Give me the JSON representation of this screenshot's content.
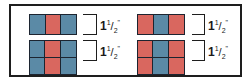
{
  "colors": {
    "blue": "#5b8aa6",
    "red": "#d9675f",
    "outline": "#1c2430"
  },
  "panels": [
    {
      "name": "left",
      "top_block": {
        "cells": [
          "blue",
          "red",
          "blue"
        ]
      },
      "bottom_block": {
        "rows": 2,
        "cells": [
          "blue",
          "red",
          "blue",
          "blue",
          "red",
          "blue"
        ]
      },
      "labels": [
        {
          "whole": "1",
          "num": "1",
          "den": "2",
          "unit": "\""
        },
        {
          "whole": "1",
          "num": "1",
          "den": "2",
          "unit": "\""
        }
      ]
    },
    {
      "name": "right",
      "top_block": {
        "cells": [
          "red",
          "blue",
          "red"
        ]
      },
      "bottom_block": {
        "rows": 2,
        "cells": [
          "red",
          "blue",
          "red",
          "red",
          "blue",
          "red"
        ]
      },
      "labels": [
        {
          "whole": "1",
          "num": "1",
          "den": "2",
          "unit": "\""
        },
        {
          "whole": "1",
          "num": "1",
          "den": "2",
          "unit": "\""
        }
      ]
    }
  ]
}
